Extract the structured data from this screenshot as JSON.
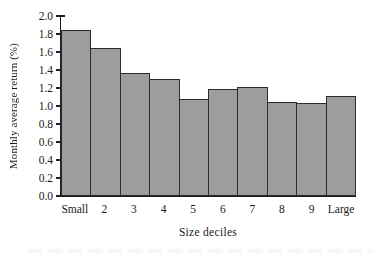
{
  "chart_data": {
    "type": "bar",
    "title": "",
    "xlabel": "Size deciles",
    "ylabel": "Monthly average return (%)",
    "categories": [
      "Small",
      "2",
      "3",
      "4",
      "5",
      "6",
      "7",
      "8",
      "9",
      "Large"
    ],
    "values": [
      1.84,
      1.65,
      1.37,
      1.3,
      1.08,
      1.19,
      1.21,
      1.05,
      1.03,
      1.11
    ],
    "ylim": [
      0.0,
      2.0
    ],
    "ytick_step": 0.2,
    "yticks_top_to_bottom": [
      "2.0",
      "1.8",
      "1.6",
      "1.4",
      "1.2",
      "1.0",
      "0.8",
      "0.6",
      "0.4",
      "0.2",
      "0.0"
    ],
    "grid": false,
    "legend": null,
    "bar_gap": 0,
    "colors": {
      "bar_fill": "#9d9d9d",
      "bar_border": "#2b2b2b",
      "axis": "#1f1f1f",
      "text": "#1a1a1a",
      "background": "#ffffff"
    }
  }
}
